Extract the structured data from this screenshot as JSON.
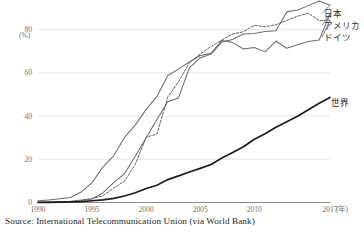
{
  "source": {
    "text": "Source: International Telecommunication Union (via World Bank)"
  },
  "axes": {
    "y_unit": "(%)",
    "y_ticks": [
      "80",
      "60",
      "40",
      "20",
      "0"
    ],
    "x_ticks": [
      "1990",
      "1995",
      "2000",
      "2005",
      "2010",
      "2017"
    ],
    "x_unit": "(年)"
  },
  "legend": {
    "japan": "日本",
    "usa": "アメリカ",
    "germany": "ドイツ",
    "world": "世界"
  },
  "colors": {
    "japan": "#6d6d6d",
    "usa": "#6d6d6d",
    "germany": "#5f5f5f",
    "world": "#1c1c1c",
    "grid": "#e2e2e2",
    "axis": "#7d7d7d"
  },
  "chart_data": {
    "type": "line",
    "title": "",
    "xlabel": "(年)",
    "ylabel": "(%)",
    "xlim": [
      1990,
      2017
    ],
    "ylim": [
      0,
      90
    ],
    "grid": true,
    "legend_position": "right-inline",
    "x": [
      1990,
      1991,
      1992,
      1993,
      1994,
      1995,
      1996,
      1997,
      1998,
      1999,
      2000,
      2001,
      2002,
      2003,
      2004,
      2005,
      2006,
      2007,
      2008,
      2009,
      2010,
      2011,
      2012,
      2013,
      2014,
      2015,
      2016,
      2017
    ],
    "series": [
      {
        "name": "日本",
        "values": [
          0.0,
          0.2,
          0.3,
          0.4,
          0.9,
          1.6,
          4.4,
          9.2,
          13.4,
          21.4,
          30.0,
          38.4,
          46.6,
          48.4,
          62.4,
          66.9,
          68.7,
          74.3,
          75.4,
          78.0,
          78.2,
          79.1,
          79.5,
          88.2,
          89.1,
          91.1,
          93.2,
          91.3
        ]
      },
      {
        "name": "アメリカ",
        "values": [
          0.8,
          1.2,
          1.7,
          2.3,
          4.9,
          9.2,
          16.4,
          21.6,
          30.1,
          35.9,
          43.1,
          49.1,
          58.8,
          61.7,
          65.0,
          68.0,
          69.0,
          75.0,
          74.0,
          71.0,
          71.7,
          69.7,
          74.7,
          71.4,
          73.0,
          74.5,
          75.2,
          87.3
        ]
      },
      {
        "name": "ドイツ",
        "values": [
          0.1,
          0.2,
          0.3,
          0.5,
          1.2,
          1.8,
          3.1,
          6.7,
          9.9,
          17.7,
          30.2,
          31.7,
          48.8,
          55.9,
          64.7,
          68.7,
          72.2,
          75.2,
          78.0,
          79.0,
          82.0,
          81.3,
          82.3,
          84.2,
          86.2,
          87.6,
          84.2,
          84.4
        ]
      },
      {
        "name": "世界",
        "values": [
          0.05,
          0.1,
          0.2,
          0.3,
          0.4,
          0.8,
          1.2,
          1.9,
          3.0,
          4.5,
          6.5,
          8.0,
          10.6,
          12.3,
          14.1,
          15.8,
          17.6,
          20.6,
          23.1,
          25.8,
          29.3,
          31.8,
          34.8,
          37.4,
          39.9,
          42.9,
          45.9,
          48.6
        ]
      }
    ]
  }
}
